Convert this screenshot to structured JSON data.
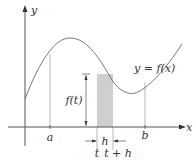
{
  "diagram": {
    "axes": {
      "x_label": "x",
      "y_label": "y"
    },
    "curve_label": "y = f(x)",
    "points": {
      "a": "a",
      "b": "b",
      "t": "t",
      "t_plus_h": "t + h"
    },
    "width_label": "h",
    "height_label": "f(t)",
    "colors": {
      "line": "#555555",
      "curve": "#777777",
      "shade": "#cfcfcf",
      "text": "#333333"
    }
  }
}
